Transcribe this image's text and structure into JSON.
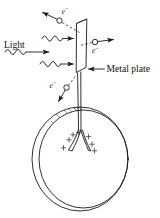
{
  "figure": {
    "width": 160,
    "height": 218,
    "background_color": "#ffffff",
    "ink_color": "#1a1a1a"
  },
  "labels": {
    "light": "Light",
    "metal_plate": "Metal plate",
    "electron_symbol": "e",
    "electron_charge_superscript": "−",
    "plus_symbol": "+"
  },
  "electrons": [
    {
      "id": "electron-top-left",
      "label": "e−",
      "circle": {
        "cx": 59.5,
        "cy": 20.5,
        "r": 2.7
      },
      "label_pos": {
        "x": 61.5,
        "y": 13.5
      },
      "arrow": {
        "x1": 56.8,
        "y1": 19.0,
        "x2": 41.5,
        "y2": 12.0
      },
      "trajectory": {
        "x1": 62.5,
        "y1": 22.5,
        "x2": 80.0,
        "y2": 32.0
      },
      "direction": "up-left"
    },
    {
      "id": "electron-right",
      "label": "e−",
      "circle": {
        "cx": 95.0,
        "cy": 42.0,
        "r": 2.7
      },
      "label_pos": {
        "x": 93.0,
        "y": 52.5
      },
      "arrow": {
        "x1": 98.0,
        "y1": 41.5,
        "x2": 114.0,
        "y2": 39.5
      },
      "trajectory": {
        "x1": 92.0,
        "y1": 42.5,
        "x2": 80.0,
        "y2": 45.0
      },
      "direction": "right"
    },
    {
      "id": "electron-lower-left",
      "label": "e−",
      "circle": {
        "cx": 66.5,
        "cy": 87.5,
        "r": 2.7
      },
      "label_pos": {
        "x": 50.0,
        "y": 87.0
      },
      "arrow": {
        "x1": 65.0,
        "y1": 90.0,
        "x2": 58.0,
        "y2": 102.0
      },
      "trajectory": {
        "x1": 68.5,
        "y1": 85.5,
        "x2": 76.0,
        "y2": 76.0
      },
      "direction": "down-left"
    }
  ],
  "light_rays": [
    {
      "id": "ray-1",
      "y": 38.5,
      "x_start": 42.0,
      "x_end": 72.5
    },
    {
      "id": "ray-2",
      "y": 50.0,
      "x_start": 12.0,
      "x_end": 55.0
    },
    {
      "id": "ray-3",
      "y": 64.0,
      "x_start": 40.0,
      "x_end": 73.0
    }
  ],
  "metal_plate": {
    "id": "metal-plate",
    "points": "76.5,23.5 86.5,19.5 85.5,68.0 76.0,72.0",
    "pointer_arrow": {
      "x1": 104.0,
      "y1": 69.0,
      "x2": 88.5,
      "y2": 69.0
    },
    "label_pos": {
      "x": 106.5,
      "y": 72.0
    }
  },
  "stem": {
    "id": "electroscope-stem",
    "left_line": {
      "x1": 77.5,
      "y1": 74.0,
      "x2": 78.5,
      "y2": 129.0
    },
    "right_line": {
      "x1": 80.5,
      "y1": 74.0,
      "x2": 80.5,
      "y2": 129.0
    }
  },
  "bulb": {
    "id": "electroscope-bulb",
    "outer": {
      "cx": 80.0,
      "cy": 159.0,
      "rx": 48.0,
      "ry": 52.0
    },
    "inner": {
      "cx": 83.5,
      "cy": 159.0,
      "rx": 44.5,
      "ry": 49.0
    },
    "hatch_side": "right",
    "hatch_line_count": 26
  },
  "leaves": {
    "id": "gold-leaves",
    "left_leaf": "M 78.5,129.0 C 76.0,136.0 73.0,142.0 69.0,149.5",
    "left_leaf_inner": "M 80.2,129.5 C 78.5,136.5 76.0,142.5 72.0,150.0",
    "right_leaf": "M 80.5,129.0 C 82.5,136.5 85.0,142.5 88.0,150.0",
    "right_leaf_inner": "M 82.0,129.5 C 84.0,136.5 86.5,142.5 90.5,150.5",
    "description": "two charged leaves repelling apart in a V"
  },
  "charges": [
    {
      "id": "plus-1",
      "x": 79.0,
      "y": 132.5
    },
    {
      "id": "plus-2",
      "x": 88.5,
      "y": 136.5
    },
    {
      "id": "plus-3",
      "x": 69.0,
      "y": 139.5
    },
    {
      "id": "plus-4",
      "x": 92.0,
      "y": 144.0
    },
    {
      "id": "plus-5",
      "x": 63.5,
      "y": 147.5
    },
    {
      "id": "plus-6",
      "x": 94.5,
      "y": 150.5
    },
    {
      "id": "plus-7",
      "x": 73.0,
      "y": 134.5
    }
  ]
}
